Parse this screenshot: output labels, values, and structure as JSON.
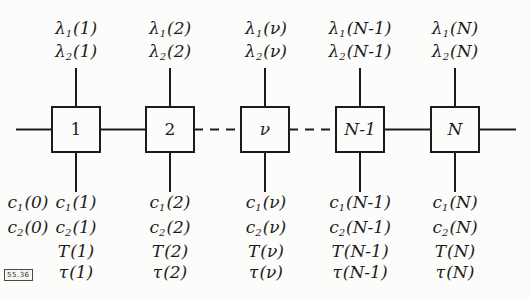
{
  "figure": {
    "stamp": "55.36",
    "ink_color": "#1c1c1c",
    "background_color": "#fcfcfa"
  },
  "initial": [
    {
      "sym": "c",
      "sub": "1",
      "arg": "(0)"
    },
    {
      "sym": "c",
      "sub": "2",
      "arg": "(0)"
    }
  ],
  "columns": [
    {
      "block": "1",
      "top": [
        {
          "sym": "λ",
          "sub": "1",
          "arg": "(1)"
        },
        {
          "sym": "λ",
          "sub": "2",
          "arg": "(1)"
        }
      ],
      "bottom": [
        {
          "sym": "c",
          "sub": "1",
          "arg": "(1)"
        },
        {
          "sym": "c",
          "sub": "2",
          "arg": "(1)"
        },
        {
          "sym": "T",
          "sub": "",
          "arg": "(1)"
        },
        {
          "sym": "τ",
          "sub": "",
          "arg": "(1)"
        }
      ]
    },
    {
      "block": "2",
      "top": [
        {
          "sym": "λ",
          "sub": "1",
          "arg": "(2)"
        },
        {
          "sym": "λ",
          "sub": "2",
          "arg": "(2)"
        }
      ],
      "bottom": [
        {
          "sym": "c",
          "sub": "1",
          "arg": "(2)"
        },
        {
          "sym": "c",
          "sub": "2",
          "arg": "(2)"
        },
        {
          "sym": "T",
          "sub": "",
          "arg": "(2)"
        },
        {
          "sym": "τ",
          "sub": "",
          "arg": "(2)"
        }
      ]
    },
    {
      "block": "ν",
      "top": [
        {
          "sym": "λ",
          "sub": "1",
          "arg": "(ν)"
        },
        {
          "sym": "λ",
          "sub": "2",
          "arg": "(ν)"
        }
      ],
      "bottom": [
        {
          "sym": "c",
          "sub": "1",
          "arg": "(ν)"
        },
        {
          "sym": "c",
          "sub": "2",
          "arg": "(ν)"
        },
        {
          "sym": "T",
          "sub": "",
          "arg": "(ν)"
        },
        {
          "sym": "τ",
          "sub": "",
          "arg": "(ν)"
        }
      ]
    },
    {
      "block": "N-1",
      "top": [
        {
          "sym": "λ",
          "sub": "1",
          "arg": "(N-1)"
        },
        {
          "sym": "λ",
          "sub": "2",
          "arg": "(N-1)"
        }
      ],
      "bottom": [
        {
          "sym": "c",
          "sub": "1",
          "arg": "(N-1)"
        },
        {
          "sym": "c",
          "sub": "2",
          "arg": "(N-1)"
        },
        {
          "sym": "T",
          "sub": "",
          "arg": "(N-1)"
        },
        {
          "sym": "τ",
          "sub": "",
          "arg": "(N-1)"
        }
      ]
    },
    {
      "block": "N",
      "top": [
        {
          "sym": "λ",
          "sub": "1",
          "arg": "(N)"
        },
        {
          "sym": "λ",
          "sub": "2",
          "arg": "(N)"
        }
      ],
      "bottom": [
        {
          "sym": "c",
          "sub": "1",
          "arg": "(N)"
        },
        {
          "sym": "c",
          "sub": "2",
          "arg": "(N)"
        },
        {
          "sym": "T",
          "sub": "",
          "arg": "(N)"
        },
        {
          "sym": "τ",
          "sub": "",
          "arg": "(N)"
        }
      ]
    }
  ]
}
